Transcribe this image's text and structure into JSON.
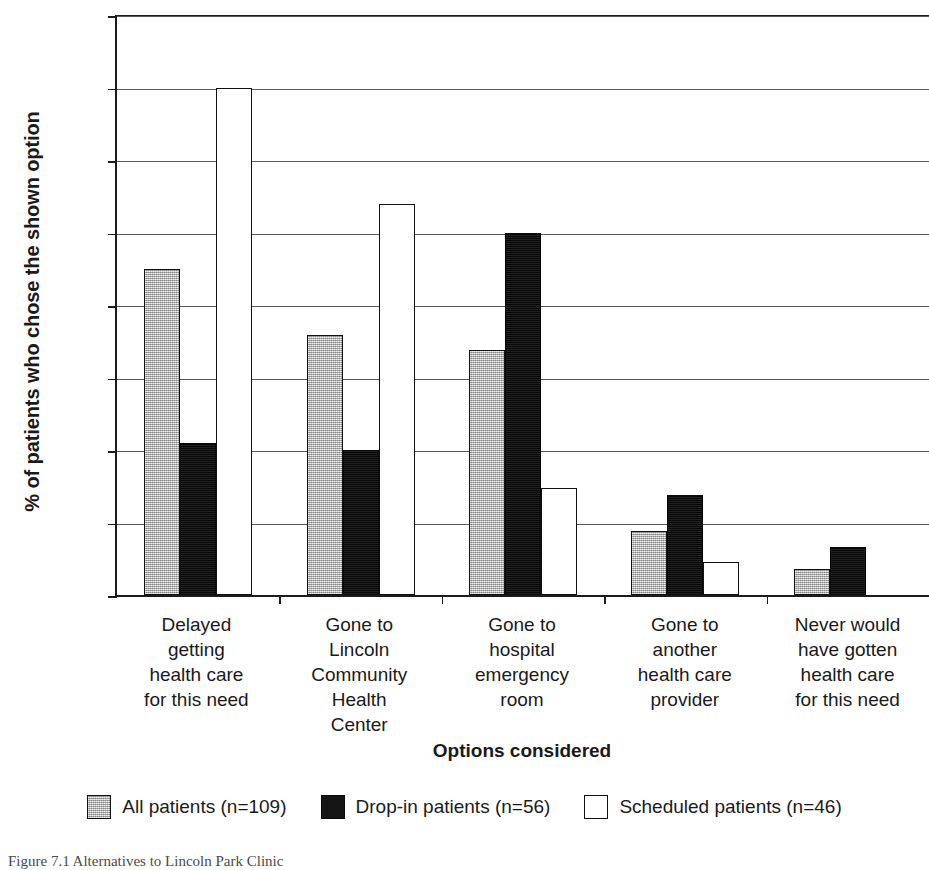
{
  "chart_data": {
    "type": "bar",
    "title": "",
    "xlabel": "Options considered",
    "ylabel": "% of patients who chose the shown option",
    "ylim": [
      0,
      80
    ],
    "ytick_values": [
      0,
      10,
      20,
      30,
      40,
      50,
      60,
      70,
      80
    ],
    "ytick_labels": [
      "0%",
      "10%",
      "20%",
      "30%",
      "40%",
      "50%",
      "60%",
      "70%",
      "80%"
    ],
    "grid": "horizontal",
    "legend_position": "bottom",
    "categories": [
      "Delayed getting health care for this need",
      "Gone to Lincoln Community Health Center",
      "Gone to hospital emergency room",
      "Gone to another health care provider",
      "Never would have gotten health care for this need"
    ],
    "category_lines": [
      [
        "Delayed",
        "getting",
        "health care",
        "for this need"
      ],
      [
        "Gone to",
        "Lincoln",
        "Community",
        "Health",
        "Center"
      ],
      [
        "Gone to",
        "hospital",
        "emergency",
        "room"
      ],
      [
        "Gone to",
        "another",
        "health care",
        "provider"
      ],
      [
        "Never would",
        "have gotten",
        "health care",
        "for this need"
      ]
    ],
    "series": [
      {
        "name": "All patients (n=109)",
        "key": "all",
        "color": "#b9b9b9",
        "values": [
          45.0,
          35.8,
          33.8,
          8.8,
          3.6
        ]
      },
      {
        "name": "Drop-in patients (n=56)",
        "key": "dropin",
        "color": "#141414",
        "values": [
          21.0,
          20.0,
          50.0,
          13.8,
          6.6
        ]
      },
      {
        "name": "Scheduled patients (n=46)",
        "key": "scheduled",
        "color": "#ffffff",
        "values": [
          70.0,
          54.0,
          14.7,
          4.6,
          0
        ]
      }
    ]
  },
  "axes": {
    "y_title": "% of patients who chose the shown option",
    "x_title": "Options considered"
  },
  "legend": {
    "items": [
      {
        "label": "All patients (n=109)",
        "swatch": "all"
      },
      {
        "label": "Drop-in patients (n=56)",
        "swatch": "dropin"
      },
      {
        "label": "Scheduled patients (n=46)",
        "swatch": "scheduled"
      }
    ]
  },
  "caption": {
    "text": "Figure 7.1 Alternatives to Lincoln Park Clinic"
  }
}
